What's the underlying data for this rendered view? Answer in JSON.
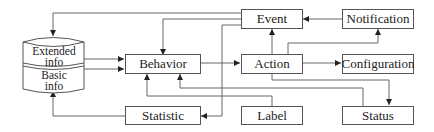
{
  "diagram": {
    "database": {
      "top_label_line1": "Extended",
      "top_label_line2": "info",
      "bottom_label_line1": "Basic",
      "bottom_label_line2": "info"
    },
    "nodes": {
      "event": "Event",
      "notification": "Notification",
      "behavior": "Behavior",
      "action": "Action",
      "configuration": "Configuration",
      "statistic": "Statistic",
      "label": "Label",
      "status": "Status"
    },
    "edges": [
      {
        "from": "Event",
        "to": "Extended info"
      },
      {
        "from": "Event",
        "to": "Behavior"
      },
      {
        "from": "Event",
        "to": "Statistic"
      },
      {
        "from": "Notification",
        "to": "Event"
      },
      {
        "from": "Extended info",
        "to": "Behavior"
      },
      {
        "from": "Basic info",
        "to": "Behavior"
      },
      {
        "from": "Behavior",
        "to": "Action"
      },
      {
        "from": "Action",
        "to": "Event"
      },
      {
        "from": "Action",
        "to": "Notification"
      },
      {
        "from": "Action",
        "to": "Configuration"
      },
      {
        "from": "Action",
        "to": "Status"
      },
      {
        "from": "Status",
        "to": "Behavior"
      },
      {
        "from": "Label",
        "to": "Behavior"
      },
      {
        "from": "Statistic",
        "to": "Basic info"
      }
    ],
    "colors": {
      "line": "#555555",
      "text": "#222222",
      "background": "#ffffff"
    }
  }
}
